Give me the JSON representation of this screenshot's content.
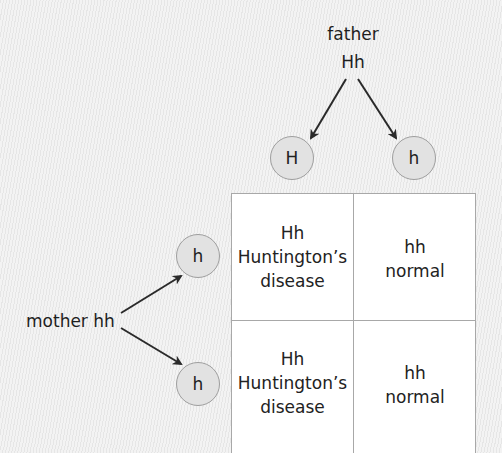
{
  "father": {
    "label": "father",
    "genotype": "Hh",
    "gametes": [
      "H",
      "h"
    ]
  },
  "mother": {
    "label": "mother hh",
    "gametes": [
      "h",
      "h"
    ]
  },
  "punnett": {
    "cells": [
      [
        {
          "genotype": "Hh",
          "phenotype_line1": "Huntington’s",
          "phenotype_line2": "disease"
        },
        {
          "genotype": "hh",
          "phenotype_line1": "normal",
          "phenotype_line2": ""
        }
      ],
      [
        {
          "genotype": "Hh",
          "phenotype_line1": "Huntington’s",
          "phenotype_line2": "disease"
        },
        {
          "genotype": "hh",
          "phenotype_line1": "normal",
          "phenotype_line2": ""
        }
      ]
    ]
  },
  "colors": {
    "background": "#ececec",
    "circle_fill": "#e2e2e2",
    "circle_border": "#9e9e9e",
    "grid_border": "#a8a8a8",
    "arrow": "#2a2a2a"
  }
}
